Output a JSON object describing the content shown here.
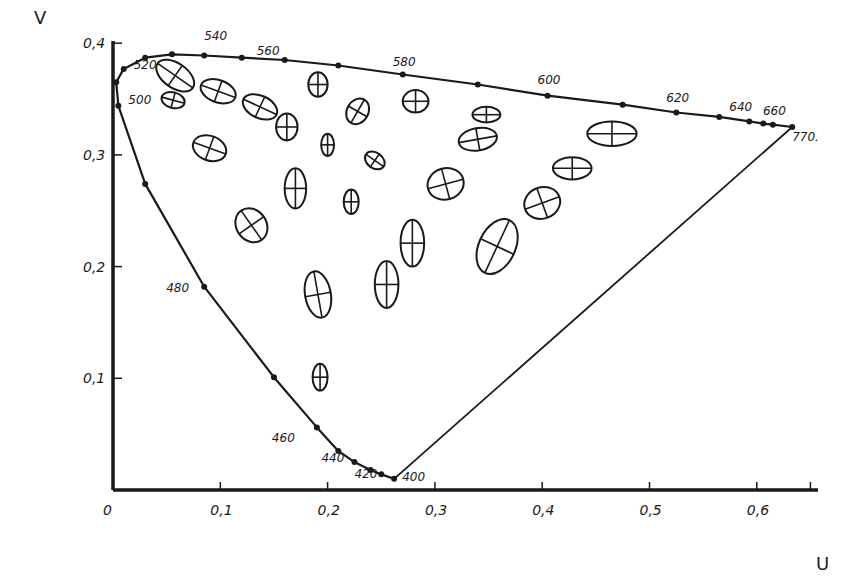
{
  "chart_data": {
    "type": "scatter",
    "title": "",
    "xlabel": "U",
    "ylabel": "V",
    "xlim": [
      0,
      0.65
    ],
    "ylim": [
      0,
      0.4
    ],
    "grid": false,
    "x_ticks": [
      "0",
      "0,1",
      "0,2",
      "0,3",
      "0,4",
      "0,5",
      "0,6"
    ],
    "y_ticks": [
      "0,1",
      "0,2",
      "0,3",
      "0,4"
    ],
    "spectral_locus": {
      "labels": [
        {
          "nm": "400",
          "u": 0.262,
          "v": 0.01
        },
        {
          "nm": "420",
          "u": 0.24,
          "v": 0.018
        },
        {
          "nm": "440",
          "u": 0.225,
          "v": 0.025
        },
        {
          "nm": "460",
          "u": 0.19,
          "v": 0.056
        },
        {
          "nm": "480",
          "u": 0.085,
          "v": 0.182
        },
        {
          "nm": "500",
          "u": 0.005,
          "v": 0.344
        },
        {
          "nm": "520",
          "u": 0.01,
          "v": 0.377
        },
        {
          "nm": "540",
          "u": 0.085,
          "v": 0.389
        },
        {
          "nm": "560",
          "u": 0.16,
          "v": 0.385
        },
        {
          "nm": "580",
          "u": 0.27,
          "v": 0.372
        },
        {
          "nm": "600",
          "u": 0.405,
          "v": 0.353
        },
        {
          "nm": "620",
          "u": 0.525,
          "v": 0.338
        },
        {
          "nm": "640",
          "u": 0.593,
          "v": 0.33
        },
        {
          "nm": "660",
          "u": 0.615,
          "v": 0.327
        },
        {
          "nm": "770.",
          "u": 0.633,
          "v": 0.325
        }
      ],
      "points": [
        [
          0.262,
          0.01
        ],
        [
          0.25,
          0.014
        ],
        [
          0.24,
          0.018
        ],
        [
          0.225,
          0.025
        ],
        [
          0.21,
          0.035
        ],
        [
          0.19,
          0.056
        ],
        [
          0.15,
          0.101
        ],
        [
          0.085,
          0.182
        ],
        [
          0.03,
          0.274
        ],
        [
          0.005,
          0.344
        ],
        [
          0.003,
          0.365
        ],
        [
          0.01,
          0.377
        ],
        [
          0.03,
          0.387
        ],
        [
          0.055,
          0.39
        ],
        [
          0.085,
          0.389
        ],
        [
          0.12,
          0.387
        ],
        [
          0.16,
          0.385
        ],
        [
          0.21,
          0.38
        ],
        [
          0.27,
          0.372
        ],
        [
          0.34,
          0.363
        ],
        [
          0.405,
          0.353
        ],
        [
          0.475,
          0.345
        ],
        [
          0.525,
          0.338
        ],
        [
          0.565,
          0.334
        ],
        [
          0.593,
          0.33
        ],
        [
          0.606,
          0.328
        ],
        [
          0.615,
          0.327
        ],
        [
          0.633,
          0.325
        ]
      ]
    },
    "purple_line": {
      "from": [
        0.262,
        0.01
      ],
      "to": [
        0.633,
        0.325
      ]
    },
    "ellipses": [
      {
        "u": 0.058,
        "v": 0.371,
        "rx": 0.02,
        "ry": 0.011,
        "angle": 35
      },
      {
        "u": 0.098,
        "v": 0.357,
        "rx": 0.017,
        "ry": 0.01,
        "angle": 20
      },
      {
        "u": 0.137,
        "v": 0.343,
        "rx": 0.017,
        "ry": 0.01,
        "angle": 25
      },
      {
        "u": 0.162,
        "v": 0.325,
        "rx": 0.01,
        "ry": 0.012,
        "angle": 0
      },
      {
        "u": 0.191,
        "v": 0.363,
        "rx": 0.009,
        "ry": 0.011,
        "angle": 0
      },
      {
        "u": 0.228,
        "v": 0.339,
        "rx": 0.01,
        "ry": 0.012,
        "angle": 30
      },
      {
        "u": 0.282,
        "v": 0.348,
        "rx": 0.012,
        "ry": 0.01,
        "angle": 0
      },
      {
        "u": 0.348,
        "v": 0.336,
        "rx": 0.013,
        "ry": 0.007,
        "angle": 0
      },
      {
        "u": 0.056,
        "v": 0.349,
        "rx": 0.011,
        "ry": 0.007,
        "angle": 15
      },
      {
        "u": 0.09,
        "v": 0.306,
        "rx": 0.016,
        "ry": 0.011,
        "angle": 20
      },
      {
        "u": 0.2,
        "v": 0.309,
        "rx": 0.006,
        "ry": 0.01,
        "angle": 0
      },
      {
        "u": 0.244,
        "v": 0.295,
        "rx": 0.01,
        "ry": 0.007,
        "angle": 35
      },
      {
        "u": 0.34,
        "v": 0.314,
        "rx": 0.018,
        "ry": 0.01,
        "angle": -10
      },
      {
        "u": 0.465,
        "v": 0.319,
        "rx": 0.023,
        "ry": 0.011,
        "angle": 0
      },
      {
        "u": 0.17,
        "v": 0.27,
        "rx": 0.01,
        "ry": 0.018,
        "angle": 0
      },
      {
        "u": 0.222,
        "v": 0.258,
        "rx": 0.007,
        "ry": 0.011,
        "angle": 0
      },
      {
        "u": 0.31,
        "v": 0.274,
        "rx": 0.017,
        "ry": 0.014,
        "angle": -15
      },
      {
        "u": 0.428,
        "v": 0.288,
        "rx": 0.018,
        "ry": 0.01,
        "angle": 0
      },
      {
        "u": 0.4,
        "v": 0.257,
        "rx": 0.017,
        "ry": 0.014,
        "angle": -20
      },
      {
        "u": 0.129,
        "v": 0.237,
        "rx": 0.014,
        "ry": 0.016,
        "angle": -35
      },
      {
        "u": 0.279,
        "v": 0.221,
        "rx": 0.011,
        "ry": 0.021,
        "angle": 0
      },
      {
        "u": 0.358,
        "v": 0.218,
        "rx": 0.017,
        "ry": 0.026,
        "angle": 25
      },
      {
        "u": 0.255,
        "v": 0.184,
        "rx": 0.011,
        "ry": 0.021,
        "angle": 0
      },
      {
        "u": 0.191,
        "v": 0.175,
        "rx": 0.012,
        "ry": 0.021,
        "angle": -10
      },
      {
        "u": 0.193,
        "v": 0.101,
        "rx": 0.007,
        "ry": 0.012,
        "angle": 0
      }
    ]
  }
}
